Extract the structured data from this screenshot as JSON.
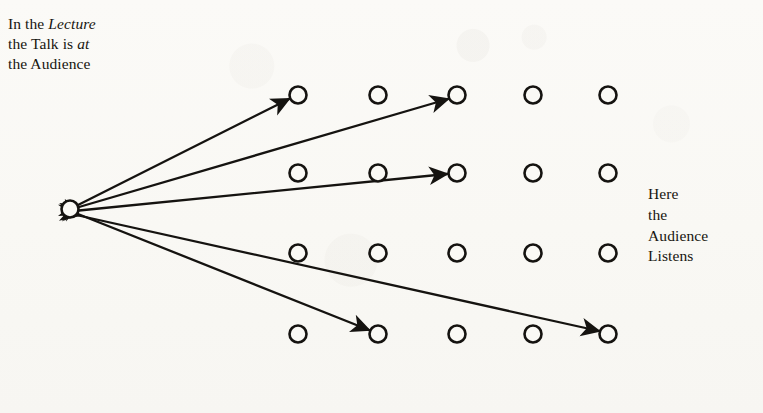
{
  "figure": {
    "caption_word": "Figure",
    "caption_number": "4",
    "background_color": "#faf9f5",
    "ink_color": "#151310"
  },
  "labels": {
    "left": {
      "name": "lecture-label",
      "line1_a": "In the ",
      "line1_em": "Lecture",
      "line2_a": "the Talk is ",
      "line2_em": "at",
      "line3": "the Audience",
      "plain_text": "In the Lecture the Talk is at the Audience"
    },
    "right": {
      "name": "audience-label",
      "line1": "Here",
      "line2": "the",
      "line3": "Audience",
      "line4": "Listens",
      "plain_text": "Here the Audience Listens"
    }
  },
  "diagram": {
    "type": "node-ray-diagram",
    "speaker": {
      "label": "speaker-node",
      "cx": 70,
      "cy": 209,
      "r": 8.5
    },
    "grid": {
      "columns": 5,
      "rows": 4,
      "radius": 8.5,
      "column_x": [
        298,
        378,
        457,
        533,
        608
      ],
      "row_y": [
        95,
        173,
        253,
        334
      ]
    },
    "rays": [
      {
        "id": "ray-1",
        "from": "speaker",
        "to_row": 1,
        "to_col": 1,
        "double_headed": true,
        "x1": 78,
        "y1": 205,
        "x2": 289,
        "y2": 99
      },
      {
        "id": "ray-2",
        "from": "speaker",
        "to_row": 1,
        "to_col": 3,
        "double_headed": true,
        "x1": 79,
        "y1": 207,
        "x2": 448,
        "y2": 99
      },
      {
        "id": "ray-3",
        "from": "speaker",
        "to_row": 2,
        "to_col": 3,
        "double_headed": true,
        "x1": 79,
        "y1": 210,
        "x2": 447,
        "y2": 174
      },
      {
        "id": "ray-4",
        "from": "speaker",
        "to_row": 4,
        "to_col": 2,
        "double_headed": true,
        "x1": 78,
        "y1": 214,
        "x2": 369,
        "y2": 330
      },
      {
        "id": "ray-5",
        "from": "speaker",
        "to_row": 4,
        "to_col": 5,
        "double_headed": true,
        "x1": 78,
        "y1": 215,
        "x2": 599,
        "y2": 331
      }
    ]
  }
}
